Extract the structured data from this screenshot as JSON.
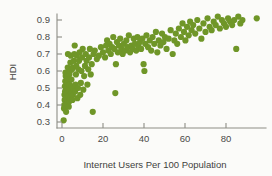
{
  "chart_data": {
    "type": "scatter",
    "title": "",
    "subtitle": "",
    "xlabel": "Internet Users Per 100 Population",
    "ylabel": "HDI",
    "xlim": [
      -4,
      100
    ],
    "ylim": [
      0.28,
      0.95
    ],
    "xticks": [
      0,
      20,
      40,
      60,
      80
    ],
    "yticks": [
      0.3,
      0.4,
      0.5,
      0.6,
      0.7,
      0.8,
      0.9
    ],
    "xtick_labels": [
      "0",
      "20",
      "40",
      "60",
      "80"
    ],
    "ytick_labels": [
      "0.3",
      "0.4",
      "0.5",
      "0.6",
      "0.7",
      "0.8",
      "0.9"
    ],
    "grid": false,
    "legend": null,
    "marker_color": "#6f9628",
    "marker_size": 3.1,
    "annotations": [],
    "points": [
      [
        0.8,
        0.31
      ],
      [
        1.0,
        0.38
      ],
      [
        1.1,
        0.4
      ],
      [
        1.3,
        0.43
      ],
      [
        1.2,
        0.46
      ],
      [
        1.5,
        0.48
      ],
      [
        1.4,
        0.51
      ],
      [
        1.6,
        0.54
      ],
      [
        1.8,
        0.57
      ],
      [
        1.7,
        0.59
      ],
      [
        2.0,
        0.36
      ],
      [
        2.2,
        0.41
      ],
      [
        2.1,
        0.44
      ],
      [
        2.4,
        0.47
      ],
      [
        2.3,
        0.5
      ],
      [
        2.6,
        0.53
      ],
      [
        2.5,
        0.56
      ],
      [
        2.8,
        0.62
      ],
      [
        2.9,
        0.7
      ],
      [
        3.1,
        0.45
      ],
      [
        3.3,
        0.39
      ],
      [
        3.5,
        0.42
      ],
      [
        3.4,
        0.49
      ],
      [
        3.7,
        0.52
      ],
      [
        3.6,
        0.58
      ],
      [
        3.9,
        0.6
      ],
      [
        4.1,
        0.65
      ],
      [
        4.3,
        0.69
      ],
      [
        4.0,
        0.44
      ],
      [
        4.5,
        0.47
      ],
      [
        4.7,
        0.51
      ],
      [
        4.6,
        0.55
      ],
      [
        4.9,
        0.61
      ],
      [
        5.1,
        0.43
      ],
      [
        5.3,
        0.46
      ],
      [
        5.5,
        0.5
      ],
      [
        5.2,
        0.62
      ],
      [
        5.8,
        0.66
      ],
      [
        6.0,
        0.7
      ],
      [
        6.2,
        0.75
      ],
      [
        6.4,
        0.48
      ],
      [
        6.6,
        0.52
      ],
      [
        6.8,
        0.58
      ],
      [
        7.0,
        0.63
      ],
      [
        7.2,
        0.69
      ],
      [
        7.5,
        0.44
      ],
      [
        7.8,
        0.5
      ],
      [
        8.0,
        0.61
      ],
      [
        8.3,
        0.66
      ],
      [
        8.6,
        0.71
      ],
      [
        8.9,
        0.46
      ],
      [
        9.2,
        0.53
      ],
      [
        9.5,
        0.6
      ],
      [
        9.8,
        0.68
      ],
      [
        10.1,
        0.73
      ],
      [
        10.4,
        0.49
      ],
      [
        10.8,
        0.57
      ],
      [
        11.2,
        0.63
      ],
      [
        11.6,
        0.7
      ],
      [
        12.0,
        0.66
      ],
      [
        12.4,
        0.52
      ],
      [
        12.8,
        0.61
      ],
      [
        13.2,
        0.68
      ],
      [
        13.6,
        0.73
      ],
      [
        14.0,
        0.58
      ],
      [
        14.5,
        0.64
      ],
      [
        15.0,
        0.36
      ],
      [
        15.4,
        0.7
      ],
      [
        16.0,
        0.72
      ],
      [
        17.0,
        0.67
      ],
      [
        18.0,
        0.69
      ],
      [
        19.0,
        0.74
      ],
      [
        20.0,
        0.71
      ],
      [
        21.0,
        0.68
      ],
      [
        21.5,
        0.75
      ],
      [
        22.0,
        0.78
      ],
      [
        22.6,
        0.72
      ],
      [
        23.2,
        0.76
      ],
      [
        23.8,
        0.7
      ],
      [
        24.4,
        0.74
      ],
      [
        25.0,
        0.8
      ],
      [
        25.5,
        0.73
      ],
      [
        26.0,
        0.47
      ],
      [
        26.3,
        0.64
      ],
      [
        26.8,
        0.77
      ],
      [
        27.2,
        0.71
      ],
      [
        27.8,
        0.75
      ],
      [
        28.4,
        0.79
      ],
      [
        29.0,
        0.73
      ],
      [
        29.6,
        0.7
      ],
      [
        30.2,
        0.76
      ],
      [
        30.8,
        0.72
      ],
      [
        31.4,
        0.78
      ],
      [
        32.0,
        0.74
      ],
      [
        32.6,
        0.81
      ],
      [
        33.2,
        0.71
      ],
      [
        33.8,
        0.75
      ],
      [
        34.4,
        0.73
      ],
      [
        35.0,
        0.79
      ],
      [
        35.6,
        0.76
      ],
      [
        36.2,
        0.72
      ],
      [
        36.8,
        0.8
      ],
      [
        37.4,
        0.74
      ],
      [
        38.0,
        0.77
      ],
      [
        38.6,
        0.73
      ],
      [
        39.2,
        0.79
      ],
      [
        39.8,
        0.64
      ],
      [
        40.2,
        0.6
      ],
      [
        40.6,
        0.76
      ],
      [
        41.2,
        0.81
      ],
      [
        42.0,
        0.74
      ],
      [
        42.8,
        0.78
      ],
      [
        43.5,
        0.72
      ],
      [
        44.2,
        0.8
      ],
      [
        45.0,
        0.76
      ],
      [
        45.8,
        0.83
      ],
      [
        46.5,
        0.71
      ],
      [
        47.2,
        0.78
      ],
      [
        48.0,
        0.75
      ],
      [
        48.8,
        0.82
      ],
      [
        49.5,
        0.77
      ],
      [
        50.2,
        0.8
      ],
      [
        51.0,
        0.73
      ],
      [
        52.0,
        0.79
      ],
      [
        53.0,
        0.84
      ],
      [
        54.0,
        0.7
      ],
      [
        54.8,
        0.78
      ],
      [
        55.5,
        0.82
      ],
      [
        56.2,
        0.76
      ],
      [
        57.0,
        0.85
      ],
      [
        58.0,
        0.8
      ],
      [
        58.8,
        0.88
      ],
      [
        59.5,
        0.83
      ],
      [
        60.2,
        0.78
      ],
      [
        61.0,
        0.86
      ],
      [
        61.8,
        0.81
      ],
      [
        62.5,
        0.89
      ],
      [
        63.2,
        0.84
      ],
      [
        64.0,
        0.87
      ],
      [
        65.0,
        0.82
      ],
      [
        66.0,
        0.9
      ],
      [
        67.0,
        0.85
      ],
      [
        68.0,
        0.79
      ],
      [
        69.0,
        0.88
      ],
      [
        70.0,
        0.83
      ],
      [
        71.0,
        0.91
      ],
      [
        72.0,
        0.86
      ],
      [
        73.0,
        0.84
      ],
      [
        74.0,
        0.89
      ],
      [
        75.0,
        0.87
      ],
      [
        76.0,
        0.92
      ],
      [
        77.0,
        0.85
      ],
      [
        78.0,
        0.9
      ],
      [
        79.0,
        0.88
      ],
      [
        80.0,
        0.86
      ],
      [
        81.0,
        0.91
      ],
      [
        82.0,
        0.89
      ],
      [
        83.0,
        0.87
      ],
      [
        84.0,
        0.9
      ],
      [
        85.0,
        0.73
      ],
      [
        86.0,
        0.92
      ],
      [
        87.0,
        0.88
      ],
      [
        88.0,
        0.9
      ],
      [
        95.0,
        0.91
      ]
    ]
  }
}
